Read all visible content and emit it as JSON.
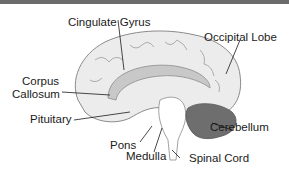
{
  "diagram": {
    "labels": {
      "cingulate_gyrus": "Cingulate Gyrus",
      "occipital_lobe": "Occipital Lobe",
      "corpus": "Corpus",
      "callosum": "Callosum",
      "pituitary": "Pituitary",
      "pons": "Pons",
      "medulla": "Medulla",
      "cerebellum": "Cerebellum",
      "spinal_cord": "Spinal Cord"
    },
    "colors": {
      "brain_fill": "#ececec",
      "outline": "#8a8a8a",
      "corpus_callosum": "#c8c8c8",
      "cerebellum": "#6e6e6e",
      "text": "#1a1a1a",
      "top_bar": "#6b6b6b"
    }
  }
}
